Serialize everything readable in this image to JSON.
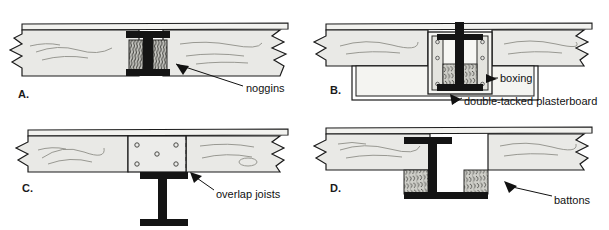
{
  "figure": {
    "background_color": "#ffffff",
    "line_color": "#1b1b1b",
    "timber_fill": "#e9e9e6",
    "steel_fill": "#141414",
    "noggin_fill": "#c9c9c4"
  },
  "panels": [
    {
      "id": "A",
      "letter": "A.",
      "description": "Timber joists either side of steel beam with noggins packed against the web",
      "callout": {
        "label": "noggins",
        "arrow": "pointer-left-up"
      }
    },
    {
      "id": "B",
      "letter": "B.",
      "description": "Steel beam encased in timber boxing with double-tacked plasterboard",
      "callouts": [
        {
          "label": "boxing",
          "arrow": "pointer-left"
        },
        {
          "label": "double-tacked plasterboard",
          "arrow": "pointer-left-up"
        }
      ]
    },
    {
      "id": "C",
      "letter": "C.",
      "description": "Joists overlapping and bolted over a steel beam, bolt plate shown",
      "callout": {
        "label": "overlap joists",
        "arrow": "pointer-left-up"
      },
      "bolt_count": 5
    },
    {
      "id": "D",
      "letter": "D.",
      "description": "Steel beam with timber battons fixed either side of the lower web",
      "callout": {
        "label": "battons",
        "arrow": "pointer-left-up"
      }
    }
  ],
  "labels": {
    "noggins": "noggins",
    "boxing": "boxing",
    "plasterboard": "double-tacked plasterboard",
    "overlap_joists": "overlap joists",
    "battons": "battons",
    "letter_a": "A.",
    "letter_b": "B.",
    "letter_c": "C.",
    "letter_d": "D."
  }
}
